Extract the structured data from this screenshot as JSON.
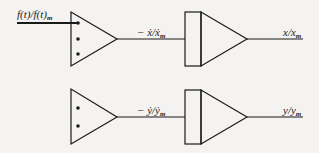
{
  "diagram": {
    "type": "block-diagram",
    "colors": {
      "line": "#1a1a1a",
      "background": "#f4f3f1"
    },
    "top_row": {
      "input_label": "f(t)/f(t)",
      "input_label_sub": "m",
      "stage1": {
        "kind": "summing-amplifier",
        "inputs": 3
      },
      "intermediate_label": "− ẋ/ẋ",
      "intermediate_label_sub": "m",
      "stage2": {
        "kind": "integrator"
      },
      "output_label": "x/x",
      "output_label_sub": "m"
    },
    "bottom_row": {
      "stage1": {
        "kind": "summing-amplifier",
        "inputs": 2
      },
      "intermediate_label": "− ẏ/ẏ",
      "intermediate_label_sub": "m",
      "stage2": {
        "kind": "integrator"
      },
      "output_label": "y/y",
      "output_label_sub": "m"
    }
  }
}
